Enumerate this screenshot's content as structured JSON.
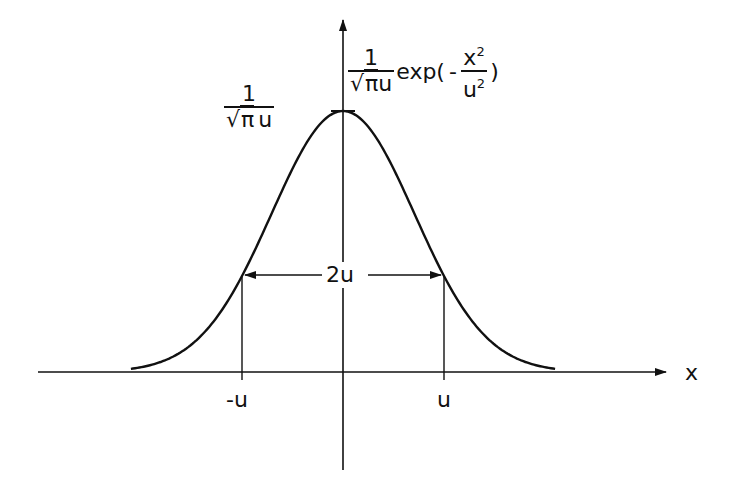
{
  "diagram": {
    "formula": {
      "prefix_numerator": "1",
      "prefix_denominator_sqrt": "√",
      "prefix_denominator_radicand": "π",
      "prefix_denominator_var": "u",
      "function": "exp(",
      "sign": "-",
      "inner_numerator": "x",
      "inner_numerator_exp": "2",
      "inner_denominator": "u",
      "inner_denominator_exp": "2",
      "close": ")"
    },
    "peak_label": {
      "numerator": "1",
      "denominator_sqrt": "√",
      "denominator_radicand": "π",
      "denominator_var": "u"
    },
    "width_label": "2u",
    "x_axis_label": "x",
    "ticks": [
      {
        "label": "-u",
        "value": -1
      },
      {
        "label": "u",
        "value": 1
      }
    ],
    "colors": {
      "line": "#111111",
      "background": "#ffffff"
    }
  },
  "chart_data": {
    "type": "line",
    "xlabel": "x",
    "ylabel": "",
    "x_ticks": [
      "-u",
      "u"
    ],
    "annotations": [
      "1/(√π u) (peak height)",
      "2u (width between points where curve falls to 1/e of peak)"
    ],
    "grid": false,
    "function": "y = 1/(sqrt(pi)*u) * exp(-x^2/u^2)",
    "x_range_in_units_of_u": [
      -2.1,
      2.1
    ],
    "series": [
      {
        "name": "Gaussian profile (u = 1)",
        "x": [
          -2.1,
          -1.5,
          -1.0,
          -0.5,
          0,
          0.5,
          1.0,
          1.5,
          2.1
        ],
        "y": [
          0.0069,
          0.0596,
          0.2076,
          0.4394,
          0.5642,
          0.4394,
          0.2076,
          0.0596,
          0.0069
        ]
      }
    ]
  }
}
